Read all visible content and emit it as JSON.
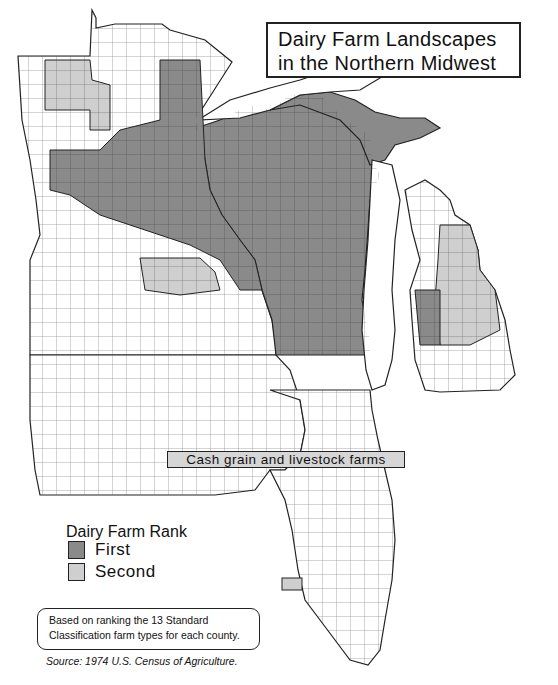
{
  "title": {
    "line1": "Dairy Farm Landscapes",
    "line2": "in the Northern Midwest"
  },
  "map_label": "Cash grain and livestock farms",
  "legend": {
    "title": "Dairy Farm Rank",
    "items": [
      {
        "label": "First",
        "color": "#8a8a8a"
      },
      {
        "label": "Second",
        "color": "#cfcfcf"
      }
    ]
  },
  "note": {
    "line1": "Based on ranking the 13 Standard",
    "line2": "Classification farm types for each county."
  },
  "source": "Source: 1974 U.S. Census of Agriculture.",
  "colors": {
    "first_rank": "#8a8a8a",
    "second_rank": "#cfcfcf",
    "none": "#ffffff",
    "border": "#222222"
  },
  "states_shown": [
    "Minnesota",
    "Wisconsin",
    "Michigan",
    "Iowa",
    "Illinois"
  ]
}
